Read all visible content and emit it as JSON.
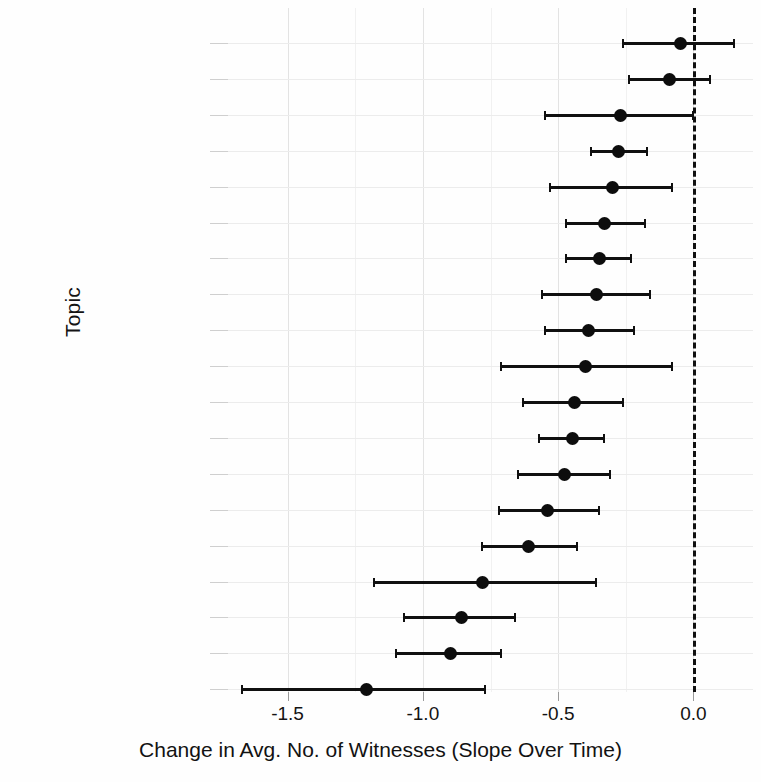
{
  "chart_data": {
    "type": "scatter",
    "title": "",
    "subtitle": "",
    "xlabel": "Change in Avg. No. of Witnesses (Slope Over Time)",
    "ylabel": "Topic",
    "xlim": [
      -1.72,
      0.22
    ],
    "xticks": [
      -1.5,
      -1.0,
      -0.5,
      0.0
    ],
    "xticklabels": [
      "-1.5",
      "-1.0",
      "-0.5",
      "0.0"
    ],
    "grid": true,
    "legend": null,
    "annotations": [
      {
        "name": "zero-reference-line",
        "type": "vline",
        "x": 0.0,
        "style": "dashed"
      }
    ],
    "error_bar_type": "confidence-interval",
    "categories": [
      "Science/Technology",
      "International Affairs",
      "Environment",
      "Govt. Operations",
      "Energy",
      "Defense",
      "Trade",
      "Housing",
      "Civil Rights/Liberties",
      "Transportation",
      "Health",
      "Public Lands/Water",
      "Banking/Commerce",
      "Macroeconomics",
      "Law/Crime/Family",
      "Agriculture",
      "Labor/Employment",
      "Education",
      "Social Welfare"
    ],
    "values": [
      -0.05,
      -0.09,
      -0.27,
      -0.28,
      -0.3,
      -0.33,
      -0.35,
      -0.36,
      -0.39,
      -0.4,
      -0.44,
      -0.45,
      -0.48,
      -0.54,
      -0.61,
      -0.78,
      -0.86,
      -0.9,
      -1.21
    ],
    "ci_low": [
      -0.26,
      -0.24,
      -0.55,
      -0.38,
      -0.53,
      -0.47,
      -0.47,
      -0.56,
      -0.55,
      -0.71,
      -0.63,
      -0.57,
      -0.65,
      -0.72,
      -0.78,
      -1.18,
      -1.07,
      -1.1,
      -1.67
    ],
    "ci_high": [
      0.15,
      0.06,
      0.0,
      -0.17,
      -0.08,
      -0.18,
      -0.23,
      -0.16,
      -0.22,
      -0.08,
      -0.26,
      -0.33,
      -0.31,
      -0.35,
      -0.43,
      -0.36,
      -0.66,
      -0.71,
      -0.77
    ],
    "points": [
      {
        "topic": "Science/Technology",
        "value": -0.05,
        "ci_low": -0.26,
        "ci_high": 0.15
      },
      {
        "topic": "International Affairs",
        "value": -0.09,
        "ci_low": -0.24,
        "ci_high": 0.06
      },
      {
        "topic": "Environment",
        "value": -0.27,
        "ci_low": -0.55,
        "ci_high": 0.0
      },
      {
        "topic": "Govt. Operations",
        "value": -0.28,
        "ci_low": -0.38,
        "ci_high": -0.17
      },
      {
        "topic": "Energy",
        "value": -0.3,
        "ci_low": -0.53,
        "ci_high": -0.08
      },
      {
        "topic": "Defense",
        "value": -0.33,
        "ci_low": -0.47,
        "ci_high": -0.18
      },
      {
        "topic": "Trade",
        "value": -0.35,
        "ci_low": -0.47,
        "ci_high": -0.23
      },
      {
        "topic": "Housing",
        "value": -0.36,
        "ci_low": -0.56,
        "ci_high": -0.16
      },
      {
        "topic": "Civil Rights/Liberties",
        "value": -0.39,
        "ci_low": -0.55,
        "ci_high": -0.22
      },
      {
        "topic": "Transportation",
        "value": -0.4,
        "ci_low": -0.71,
        "ci_high": -0.08
      },
      {
        "topic": "Health",
        "value": -0.44,
        "ci_low": -0.63,
        "ci_high": -0.26
      },
      {
        "topic": "Public Lands/Water",
        "value": -0.45,
        "ci_low": -0.57,
        "ci_high": -0.33
      },
      {
        "topic": "Banking/Commerce",
        "value": -0.48,
        "ci_low": -0.65,
        "ci_high": -0.31
      },
      {
        "topic": "Macroeconomics",
        "value": -0.54,
        "ci_low": -0.72,
        "ci_high": -0.35
      },
      {
        "topic": "Law/Crime/Family",
        "value": -0.61,
        "ci_low": -0.78,
        "ci_high": -0.43
      },
      {
        "topic": "Agriculture",
        "value": -0.78,
        "ci_low": -1.18,
        "ci_high": -0.36
      },
      {
        "topic": "Labor/Employment",
        "value": -0.86,
        "ci_low": -1.07,
        "ci_high": -0.66
      },
      {
        "topic": "Education",
        "value": -0.9,
        "ci_low": -1.1,
        "ci_high": -0.71
      },
      {
        "topic": "Social Welfare",
        "value": -1.21,
        "ci_low": -1.67,
        "ci_high": -0.77
      }
    ]
  },
  "colors": {
    "point": "#0d0d0d",
    "error_bar": "#101010",
    "zero_line": "#101010",
    "grid": "#e3e3e3",
    "background": "#ffffff",
    "text": "#141414"
  }
}
